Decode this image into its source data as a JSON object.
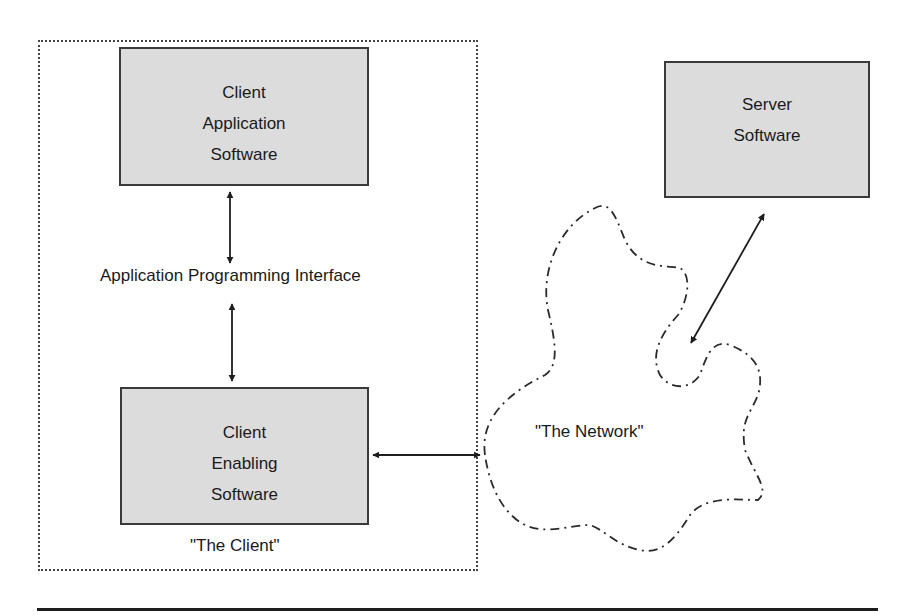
{
  "diagram": {
    "client_boundary_label": "\"The Client\"",
    "network_label": "\"The Network\"",
    "api_label": "Application Programming Interface",
    "boxes": {
      "client_application": {
        "lines": [
          "Client",
          "Application",
          "Software"
        ]
      },
      "client_enabling": {
        "lines": [
          "Client",
          "Enabling",
          "Software"
        ]
      },
      "server": {
        "lines": [
          "Server",
          "Software"
        ]
      }
    },
    "colors": {
      "box_fill": "#dcdcdc",
      "box_border": "#3a3a3a",
      "line": "#1e1e1e"
    }
  }
}
